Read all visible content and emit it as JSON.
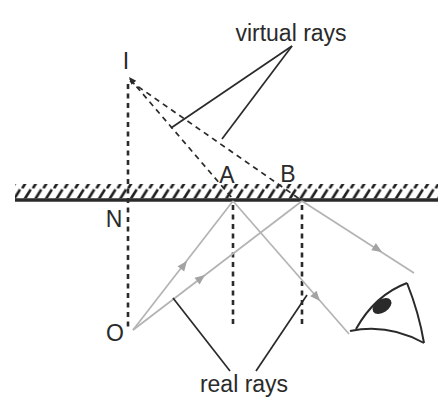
{
  "figure": {
    "labels": {
      "image_point": "I",
      "normal_foot": "N",
      "object_point": "O",
      "point_a": "A",
      "point_b": "B",
      "virtual_rays": "virtual rays",
      "real_rays": "real rays"
    },
    "colors": {
      "line_black": "#2a2a2a",
      "ray_gray": "#b3b3b3",
      "arrow_gray": "#a3a3a3",
      "background": "#ffffff"
    },
    "icons": {
      "eye": "eye-icon"
    }
  }
}
